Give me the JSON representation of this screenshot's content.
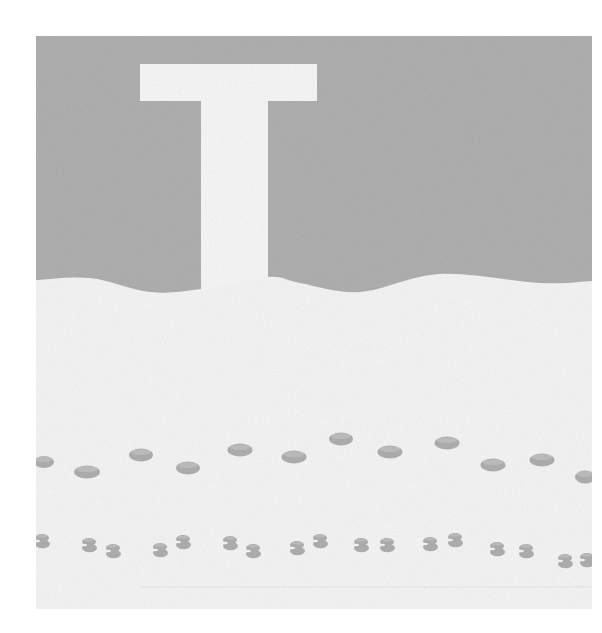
{
  "canvas": {
    "width": 602,
    "height": 633,
    "background": "#ffffff"
  },
  "picture": {
    "frame": {
      "x": 36,
      "y": 36,
      "width": 556,
      "height": 573
    },
    "colors": {
      "sky": "#aaaaaa",
      "snow": "#f4f4f4",
      "letter": "#f6f6f6",
      "footprint": "#a9a9a9",
      "footprint_highlight": "#c4c4c4",
      "ground_line": "#e2e2e2"
    },
    "letter": {
      "glyph": "T",
      "bar": {
        "x": 140,
        "y": 64,
        "width": 177,
        "height": 37
      },
      "stem": {
        "x": 201,
        "y": 100,
        "width": 67,
        "height": 200
      }
    },
    "horizon_wave": [
      [
        36,
        280
      ],
      [
        90,
        278
      ],
      [
        150,
        292
      ],
      [
        201,
        289
      ],
      [
        268,
        277
      ],
      [
        300,
        283
      ],
      [
        360,
        292
      ],
      [
        440,
        274
      ],
      [
        540,
        283
      ],
      [
        592,
        281
      ]
    ],
    "ground_line": {
      "x1": 140,
      "y1": 587,
      "x2": 592,
      "y2": 587
    },
    "boot_prints": [
      {
        "cx": 44,
        "cy": 462,
        "rx": 10,
        "ry": 6
      },
      {
        "cx": 87,
        "cy": 472,
        "rx": 13,
        "ry": 6.5
      },
      {
        "cx": 141,
        "cy": 455,
        "rx": 12,
        "ry": 6.5
      },
      {
        "cx": 188,
        "cy": 468,
        "rx": 12,
        "ry": 6.5
      },
      {
        "cx": 240,
        "cy": 450,
        "rx": 12.5,
        "ry": 6.5
      },
      {
        "cx": 294,
        "cy": 457,
        "rx": 12.5,
        "ry": 6.5
      },
      {
        "cx": 341,
        "cy": 439,
        "rx": 12,
        "ry": 6.5
      },
      {
        "cx": 390,
        "cy": 452,
        "rx": 12.5,
        "ry": 6.5
      },
      {
        "cx": 447,
        "cy": 443,
        "rx": 12.5,
        "ry": 6.5
      },
      {
        "cx": 493,
        "cy": 465,
        "rx": 12.5,
        "ry": 6.5
      },
      {
        "cx": 542,
        "cy": 460,
        "rx": 12.5,
        "ry": 6.5
      },
      {
        "cx": 585,
        "cy": 477,
        "rx": 10,
        "ry": 6.5
      }
    ],
    "paw_prints": [
      {
        "cx": 42,
        "cy": 541
      },
      {
        "cx": 89,
        "cy": 545
      },
      {
        "cx": 113,
        "cy": 551
      },
      {
        "cx": 160,
        "cy": 550
      },
      {
        "cx": 183,
        "cy": 542
      },
      {
        "cx": 230,
        "cy": 543
      },
      {
        "cx": 253,
        "cy": 551
      },
      {
        "cx": 297,
        "cy": 548
      },
      {
        "cx": 320,
        "cy": 541
      },
      {
        "cx": 361,
        "cy": 545
      },
      {
        "cx": 387,
        "cy": 545
      },
      {
        "cx": 430,
        "cy": 544
      },
      {
        "cx": 455,
        "cy": 540
      },
      {
        "cx": 497,
        "cy": 549
      },
      {
        "cx": 526,
        "cy": 551
      },
      {
        "cx": 565,
        "cy": 561
      },
      {
        "cx": 587,
        "cy": 560
      }
    ]
  }
}
